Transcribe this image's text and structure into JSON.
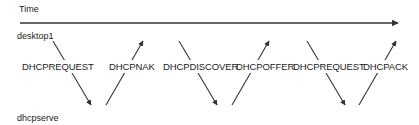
{
  "diagram": {
    "time_label": "Time",
    "top_lane": "desktop1",
    "bottom_lane": "dhcpserve",
    "messages": [
      {
        "label": "DHCPREQUEST",
        "direction": "down",
        "from": "desktop1",
        "to": "dhcpserve"
      },
      {
        "label": "DHCPNAK",
        "direction": "up",
        "from": "dhcpserve",
        "to": "desktop1"
      },
      {
        "label": "DHCPDISCOVER",
        "direction": "down",
        "from": "desktop1",
        "to": "dhcpserve"
      },
      {
        "label": "DHCPOFFER",
        "direction": "up",
        "from": "dhcpserve",
        "to": "desktop1"
      },
      {
        "label": "DHCPREQUEST",
        "direction": "down",
        "from": "desktop1",
        "to": "dhcpserve"
      },
      {
        "label": "DHCPACK",
        "direction": "up",
        "from": "dhcpserve",
        "to": "desktop1"
      }
    ],
    "colors": {
      "line": "#333333",
      "text": "#222222",
      "background": "#ffffff"
    }
  }
}
